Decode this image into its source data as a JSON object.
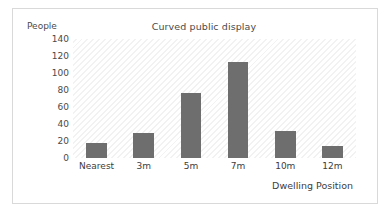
{
  "chart_data": {
    "type": "bar",
    "title": "Curved public display",
    "xlabel": "Dwelling Position",
    "ylabel": "People",
    "categories": [
      "Nearest",
      "3m",
      "5m",
      "7m",
      "10m",
      "12m"
    ],
    "values": [
      18,
      29,
      76,
      113,
      32,
      14
    ],
    "yticks": [
      140,
      120,
      100,
      80,
      60,
      40,
      20,
      0
    ],
    "ylim": [
      0,
      140
    ],
    "grid": false,
    "legend": false,
    "series": [
      {
        "name": "People",
        "values": [
          18,
          29,
          76,
          113,
          32,
          14
        ]
      }
    ],
    "colors": {
      "bar": "#6e6e6e",
      "plot_background": "#ffffff",
      "hatch": "#f2f2f2",
      "frame_border": "#d9d9d9",
      "text": "#4a4a4a"
    }
  }
}
